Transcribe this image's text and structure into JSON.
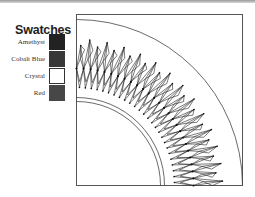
{
  "legend": {
    "title": "Swatches",
    "items": [
      {
        "label": "Amethyst",
        "color": "#222222",
        "border": "#222222"
      },
      {
        "label": "Cobalt Blue",
        "color": "#383838",
        "border": "#383838"
      },
      {
        "label": "Crystal",
        "color": "#ffffff",
        "border": "#333333"
      },
      {
        "label": "Red",
        "color": "#474747",
        "border": "#474747"
      }
    ]
  },
  "diagram": {
    "frame_color": "#555555",
    "line_color": "#222222"
  }
}
